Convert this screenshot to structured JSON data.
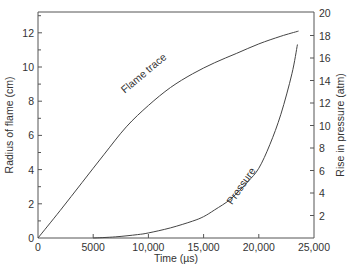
{
  "chart_data": {
    "type": "line",
    "title": "",
    "xlabel": "Time (µs)",
    "ylabel": "Radius of flame (cm)",
    "y2label": "Rise in pressure (atm)",
    "xlim": [
      0,
      25000
    ],
    "ylim": [
      0,
      13.2
    ],
    "y2lim": [
      0,
      20
    ],
    "grid": false,
    "legend": "none",
    "x_ticks": [
      0,
      5000,
      10000,
      15000,
      20000,
      25000
    ],
    "x_tick_labels": [
      "0",
      "5000",
      "10,000",
      "15,000",
      "20,000",
      "25,000"
    ],
    "y_ticks": [
      0,
      2,
      4,
      6,
      8,
      10,
      12
    ],
    "y_tick_labels": [
      "0",
      "2",
      "4",
      "6",
      "8",
      "10",
      "12"
    ],
    "y_minor_ticks": [
      1,
      3,
      5,
      7,
      9,
      11,
      13
    ],
    "y2_ticks": [
      2,
      4,
      6,
      8,
      10,
      12,
      14,
      16,
      18,
      20
    ],
    "y2_tick_labels": [
      "2",
      "4",
      "6",
      "8",
      "10",
      "12",
      "14",
      "16",
      "18",
      "20"
    ],
    "series": [
      {
        "name": "Flame trace",
        "axis": "left",
        "x": [
          0,
          2000,
          4000,
          6000,
          8000,
          10000,
          12000,
          14000,
          16000,
          18000,
          20000,
          22000,
          23600
        ],
        "y": [
          0,
          1.6,
          3.25,
          4.9,
          6.5,
          7.75,
          8.8,
          9.6,
          10.25,
          10.8,
          11.35,
          11.8,
          12.1
        ],
        "annotation": "Flame trace"
      },
      {
        "name": "Pressure",
        "axis": "right",
        "x": [
          5000,
          7000,
          9000,
          10000,
          12000,
          14000,
          15000,
          16000,
          17500,
          19000,
          20000,
          21000,
          22000,
          23000,
          23500
        ],
        "y": [
          0,
          0.1,
          0.3,
          0.45,
          0.9,
          1.5,
          1.9,
          2.5,
          3.5,
          5.0,
          6.2,
          8.3,
          11.0,
          14.6,
          17.2
        ],
        "annotation": "Pressure"
      }
    ]
  }
}
